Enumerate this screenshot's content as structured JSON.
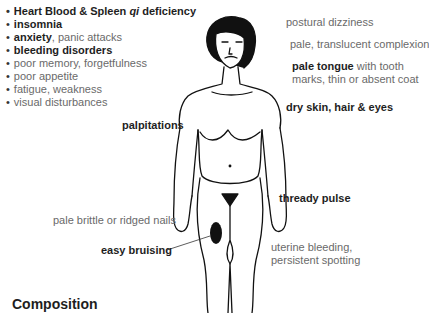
{
  "diagram": {
    "heading_list": [
      {
        "bold": "Heart Blood & Spleen ",
        "italic": "qi",
        "rest": " deficiency",
        "all_bold": true
      },
      {
        "bold": "insomnia",
        "rest": ""
      },
      {
        "bold": "anxiety",
        "rest": ", panic attacks"
      },
      {
        "bold": "bleeding disorders",
        "rest": ""
      },
      {
        "bold": "",
        "rest": "poor memory, forgetfulness"
      },
      {
        "bold": "",
        "rest": "poor appetite"
      },
      {
        "bold": "",
        "rest": "fatigue, weakness"
      },
      {
        "bold": "",
        "rest": "visual disturbances"
      }
    ],
    "labels": {
      "postural_dizziness": "postural dizziness",
      "complexion": "pale, translucent complexion",
      "tongue_bold": "pale tongue",
      "tongue_rest": " with tooth",
      "tongue_line2": "marks, thin or absent coat",
      "dry_skin": "dry skin, hair & eyes",
      "palpitations": "palpitations",
      "thready_pulse": "thready pulse",
      "nails": "pale brittle or ridged nails",
      "easy_bruising": "easy bruising",
      "uterine_line1": "uterine bleeding,",
      "uterine_line2": "persistent spotting"
    },
    "footer_title": "Composition",
    "colors": {
      "bold_text": "#1e1e1e",
      "regular_text": "#6a6a6a",
      "line_art": "#111111"
    }
  }
}
